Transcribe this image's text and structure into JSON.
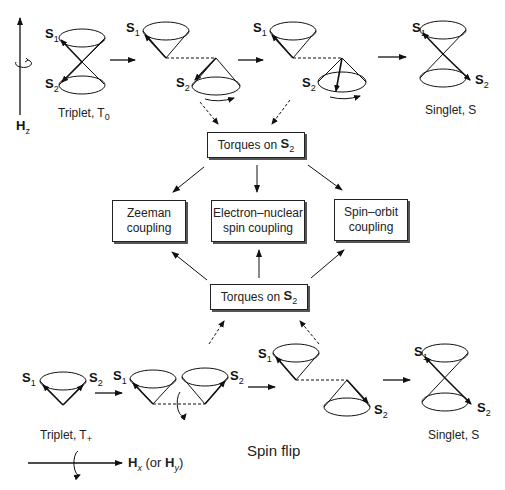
{
  "figure": {
    "top_row": {
      "field_label": "H",
      "field_sub": "z",
      "start_state": "Triplet, T",
      "start_state_sub": "0",
      "end_state": "Singlet, S"
    },
    "spin_labels": {
      "s1": "S",
      "s1_sub": "1",
      "s2": "S",
      "s2_sub": "2"
    },
    "torque_box_top": {
      "text": "Torques on ",
      "spin": "S",
      "spin_sub": "2"
    },
    "torque_box_bottom": {
      "text": "Torques on ",
      "spin": "S",
      "spin_sub": "2"
    },
    "coupling_boxes": [
      {
        "line1": "Zeeman",
        "line2": "coupling"
      },
      {
        "line1": "Electron–nuclear",
        "line2": "spin coupling"
      },
      {
        "line1": "Spin–orbit",
        "line2": "coupling"
      }
    ],
    "bottom_row": {
      "start_state": "Triplet, T",
      "start_state_sub": "+",
      "process_label": "Spin flip",
      "end_state": "Singlet, S",
      "field_label": "H",
      "field_sub": "x",
      "field_alt_prefix": " (or ",
      "field_alt": "H",
      "field_alt_sub": "y",
      "field_alt_suffix": ")"
    }
  }
}
